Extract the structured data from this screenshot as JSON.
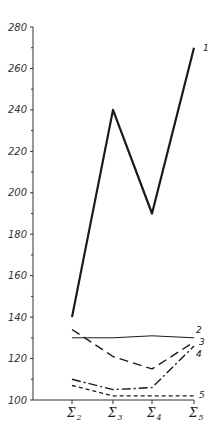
{
  "chart_data": {
    "type": "line",
    "title": "",
    "xlabel": "",
    "ylabel": "",
    "categories": [
      "Σ2",
      "Σ3",
      "Σ4",
      "Σ5"
    ],
    "category_parts": [
      {
        "main": "Σ",
        "sub": "2"
      },
      {
        "main": "Σ",
        "sub": "3"
      },
      {
        "main": "Σ",
        "sub": "4"
      },
      {
        "main": "Σ",
        "sub": "5"
      }
    ],
    "ylim": [
      100,
      280
    ],
    "yticks_major": [
      100,
      120,
      140,
      160,
      180,
      200,
      220,
      240,
      260,
      280
    ],
    "yticks_minor": [
      110,
      130,
      150,
      170,
      190,
      210,
      230,
      250,
      270
    ],
    "grid": false,
    "legend": "inline labels at right end of each line",
    "series": [
      {
        "name": "1",
        "style": "solid-thick",
        "values": [
          140,
          240,
          190,
          270
        ]
      },
      {
        "name": "2",
        "style": "solid-thin",
        "values": [
          130,
          130,
          131,
          130
        ]
      },
      {
        "name": "3",
        "style": "long-dash",
        "values": [
          134,
          121,
          115,
          128
        ]
      },
      {
        "name": "4",
        "style": "dash-dot",
        "values": [
          110,
          105,
          106,
          126
        ]
      },
      {
        "name": "5",
        "style": "short-dash",
        "values": [
          107,
          102,
          102,
          102
        ]
      }
    ]
  },
  "colors": {
    "line": "#1a1a1a",
    "axis": "#333333",
    "background": "#ffffff"
  }
}
